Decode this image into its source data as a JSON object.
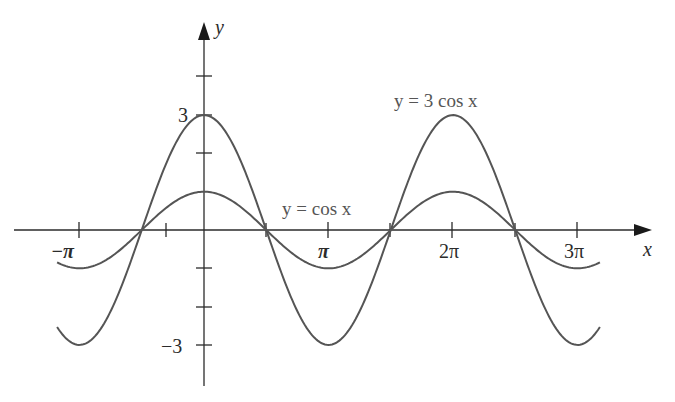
{
  "chart_data": {
    "type": "line",
    "title": "",
    "xlabel": "x",
    "ylabel": "y",
    "xlim": [
      -3.52,
      3.18
    ],
    "xlim_units": "multiples of pi",
    "ylim": [
      -4.5,
      4.0
    ],
    "x_ticks": [
      -1,
      1,
      2,
      3
    ],
    "x_tick_labels": [
      "−π",
      "π",
      "2π",
      "3π"
    ],
    "y_ticks": [
      -3,
      -2,
      -1,
      1,
      2,
      3,
      4
    ],
    "y_tick_labels": {
      "3": "3",
      "-3": "−3"
    },
    "grid": false,
    "legend": "inline labels",
    "series": [
      {
        "name": "y = 3 cos x",
        "amplitude": 3,
        "formula": "3*cos(x)",
        "x_range_pi": [
          -1.18,
          3.18
        ],
        "label": "y = 3 cos x"
      },
      {
        "name": "y = cos x",
        "amplitude": 1,
        "formula": "cos(x)",
        "x_range_pi": [
          -1.18,
          3.18
        ],
        "label": "y = cos x"
      }
    ],
    "intersections_x_pi": [
      -0.5,
      0.5,
      1.5,
      2.5
    ]
  },
  "axes": {
    "x_label": "x",
    "y_label": "y",
    "tick_label_3": "3",
    "tick_label_neg3": "−3",
    "x_tick_labels": [
      "−π",
      "π",
      "2π",
      "3π"
    ]
  },
  "labels": {
    "curve_3cos": "y = 3 cos x",
    "curve_cos": "y = cos x"
  },
  "colors": {
    "curve": "#555555",
    "axis": "#2b2b2b",
    "background": "#ffffff"
  }
}
